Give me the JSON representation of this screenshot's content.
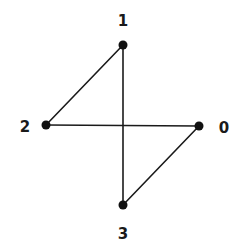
{
  "diagram": {
    "type": "graph",
    "width": 241,
    "height": 251,
    "colors": {
      "background": "#ffffff",
      "edge": "#1a1a1a",
      "node": "#111111",
      "label": "#1a1a1a"
    },
    "nodes": [
      {
        "id": "0",
        "label": "0",
        "x": 199,
        "y": 126,
        "label_x": 224,
        "label_y": 133
      },
      {
        "id": "1",
        "label": "1",
        "x": 123,
        "y": 45,
        "label_x": 123,
        "label_y": 26
      },
      {
        "id": "2",
        "label": "2",
        "x": 46,
        "y": 125,
        "label_x": 25,
        "label_y": 132
      },
      {
        "id": "3",
        "label": "3",
        "x": 123,
        "y": 205,
        "label_x": 123,
        "label_y": 239
      }
    ],
    "edges": [
      {
        "from": "1",
        "to": "2"
      },
      {
        "from": "1",
        "to": "3"
      },
      {
        "from": "2",
        "to": "0"
      },
      {
        "from": "0",
        "to": "3"
      }
    ]
  }
}
